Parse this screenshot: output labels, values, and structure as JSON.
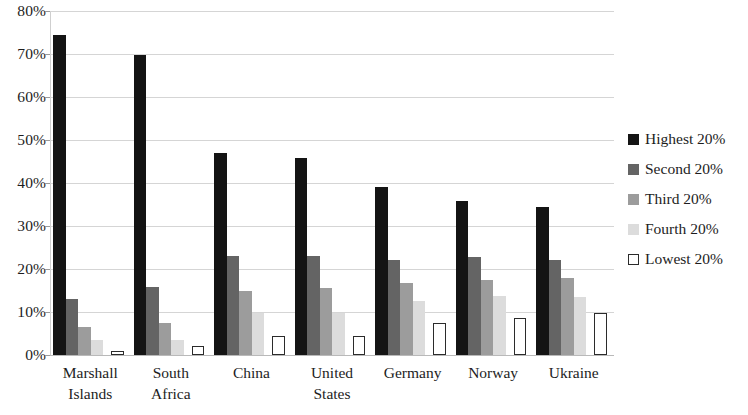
{
  "chart_data": {
    "type": "bar",
    "title": "",
    "subtitle": "",
    "xlabel": "",
    "ylabel": "",
    "ylim": [
      0,
      80
    ],
    "ytick_labels": [
      "0%",
      "10%",
      "20%",
      "30%",
      "40%",
      "50%",
      "60%",
      "70%",
      "80%"
    ],
    "ytick_values": [
      0,
      10,
      20,
      30,
      40,
      50,
      60,
      70,
      80
    ],
    "grid": true,
    "legend_position": "right",
    "categories": [
      "Marshall Islands",
      "South Africa",
      "China",
      "United States",
      "Germany",
      "Norway",
      "Ukraine"
    ],
    "category_lines": [
      [
        "Marshall",
        "Islands"
      ],
      [
        "South",
        "Africa"
      ],
      [
        "China",
        ""
      ],
      [
        "United",
        "States"
      ],
      [
        "Germany",
        ""
      ],
      [
        "Norway",
        ""
      ],
      [
        "Ukraine",
        ""
      ]
    ],
    "series": [
      {
        "name": "Highest 20%",
        "color": "#141414",
        "values": [
          74.5,
          69.8,
          47.0,
          45.8,
          39.0,
          35.8,
          34.5
        ]
      },
      {
        "name": "Second 20%",
        "color": "#646464",
        "values": [
          13.0,
          15.8,
          23.0,
          23.0,
          22.0,
          22.8,
          22.0
        ]
      },
      {
        "name": "Third 20%",
        "color": "#9c9c9c",
        "values": [
          6.5,
          7.5,
          14.8,
          15.5,
          16.8,
          17.5,
          17.8
        ]
      },
      {
        "name": "Fourth 20%",
        "color": "#dcdcdc",
        "values": [
          3.5,
          3.5,
          9.8,
          9.8,
          12.5,
          13.8,
          13.5
        ]
      },
      {
        "name": "Lowest 20%",
        "color": "#ffffff",
        "values": [
          1.0,
          2.0,
          4.5,
          4.5,
          7.5,
          8.5,
          9.8
        ]
      }
    ]
  },
  "legend": {
    "items": [
      {
        "label": "Highest 20%",
        "swatch": "series-0-swatch"
      },
      {
        "label": "Second 20%",
        "swatch": "series-1-swatch"
      },
      {
        "label": "Third 20%",
        "swatch": "series-2-swatch"
      },
      {
        "label": "Fourth 20%",
        "swatch": "series-3-swatch"
      },
      {
        "label": "Lowest 20%",
        "swatch": "series-4-swatch"
      }
    ]
  }
}
